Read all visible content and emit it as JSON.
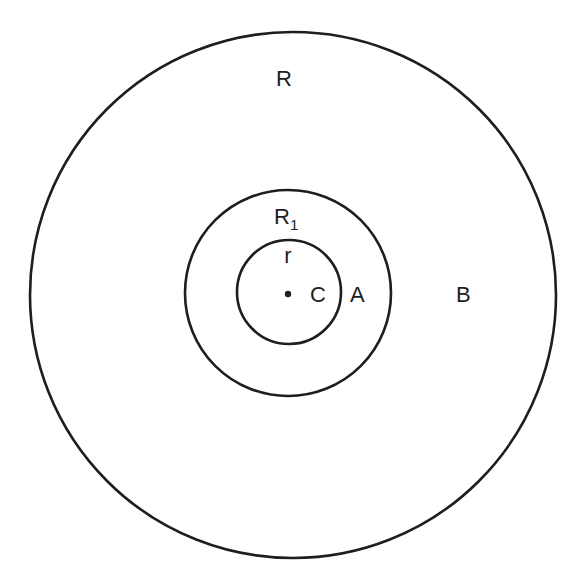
{
  "diagram": {
    "title": "",
    "circles": [
      {
        "id": "outer",
        "radius_label": "R",
        "region_label": "B"
      },
      {
        "id": "middle",
        "radius_label": "R",
        "radius_label_subscript": "1",
        "region_label": "A"
      },
      {
        "id": "inner",
        "radius_label": "r",
        "center_label": "C"
      }
    ],
    "labels": {
      "outer_radius": "R",
      "middle_radius_main": "R",
      "middle_radius_sub": "1",
      "inner_radius": "r",
      "center": "C",
      "region_a": "A",
      "region_b": "B"
    },
    "colors": {
      "stroke": "#1e1e1e",
      "background": "#ffffff"
    }
  }
}
